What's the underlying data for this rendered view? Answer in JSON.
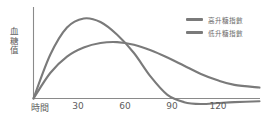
{
  "chart_data": {
    "type": "line",
    "title": "",
    "xlabel": "時間",
    "ylabel": "血糖值",
    "grid": false,
    "legend_position": "top-right",
    "x": [
      0,
      10,
      20,
      30,
      40,
      50,
      60,
      70,
      80,
      90,
      100,
      110,
      120,
      135
    ],
    "xlim": [
      0,
      135
    ],
    "ylim": [
      -8,
      100
    ],
    "xticks": [
      "時間",
      "30",
      "60",
      "90",
      "120"
    ],
    "xtick_values": [
      0,
      30,
      60,
      90,
      120
    ],
    "series": [
      {
        "name": "高升糖指數",
        "color": "#7a7a7a",
        "values": [
          0,
          48,
          78,
          88,
          84,
          70,
          50,
          24,
          4,
          -4,
          -6,
          -5,
          -4,
          -3
        ]
      },
      {
        "name": "低升糖指數",
        "color": "#7a7a7a",
        "values": [
          0,
          28,
          46,
          56,
          61,
          62,
          59,
          53,
          45,
          36,
          27,
          20,
          15,
          12
        ]
      }
    ]
  },
  "axes": {
    "y_axis_label": "血\n糖\n值",
    "x_axis_ticks": [
      {
        "label": "時間",
        "x": 40
      },
      {
        "label": "30",
        "x": 78
      },
      {
        "label": "60",
        "x": 125
      },
      {
        "label": "90",
        "x": 172
      },
      {
        "label": "120",
        "x": 218
      }
    ]
  },
  "legend": {
    "items": [
      {
        "label": "高升糖指數",
        "color": "#7a7a7a"
      },
      {
        "label": "低升糖指數",
        "color": "#7a7a7a"
      }
    ]
  },
  "colors": {
    "axis": "#8a8a8a",
    "curve_high": "#7a7a7a",
    "curve_low": "#7a7a7a",
    "text": "#5d5d5d",
    "background": "#ffffff"
  }
}
